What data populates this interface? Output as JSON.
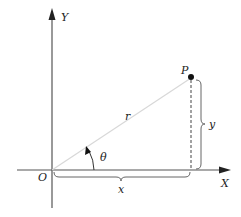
{
  "diagram": {
    "labels": {
      "y_axis": "Y",
      "x_axis": "X",
      "origin": "O",
      "point": "P",
      "radius": "r",
      "angle": "θ",
      "x_component": "x",
      "y_component": "y"
    },
    "colors": {
      "axis": "#555555",
      "radius_line": "#d8d8d8",
      "dashed_line": "#444444",
      "brace": "#666666",
      "point": "#111111",
      "text": "#222222"
    }
  }
}
